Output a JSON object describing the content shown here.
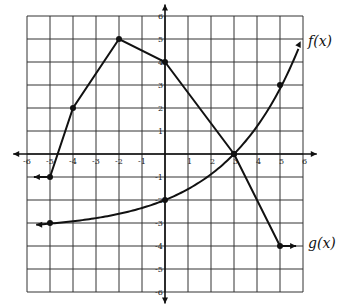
{
  "chart_data": {
    "type": "line",
    "title": "",
    "xlabel": "",
    "ylabel": "",
    "xlim": [
      -6,
      6
    ],
    "ylim": [
      -6,
      6
    ],
    "grid": true,
    "x_ticks": [
      "-6",
      "-5",
      "-4",
      "-3",
      "-2",
      "-1",
      "1",
      "2",
      "3",
      "4",
      "5",
      "6"
    ],
    "y_ticks": [
      "6",
      "5",
      "4",
      "3",
      "2",
      "1",
      "-1",
      "-2",
      "-3",
      "-4",
      "-5",
      "-6"
    ],
    "series": [
      {
        "name": "g(x)",
        "label": "g(x)",
        "kind": "piecewise-linear",
        "points": [
          [
            -5,
            -1
          ],
          [
            -4,
            2
          ],
          [
            -2,
            5
          ],
          [
            0,
            4
          ],
          [
            3,
            0
          ],
          [
            5,
            -4
          ]
        ],
        "left_ray_to": [
          -5.7,
          -1
        ],
        "right_ray_to": [
          5.7,
          -4
        ]
      },
      {
        "name": "f(x)",
        "label": "f(x)",
        "kind": "exponential",
        "points": [
          [
            -5,
            -3
          ],
          [
            0,
            -2
          ],
          [
            3,
            0
          ],
          [
            5,
            3
          ]
        ],
        "left_arrow_to": [
          -5.6,
          -3
        ],
        "right_arrow_to": [
          6,
          5
        ]
      }
    ]
  }
}
